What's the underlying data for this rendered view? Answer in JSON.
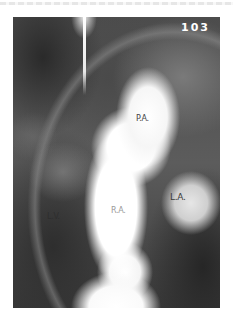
{
  "image": {
    "frame_number": "103",
    "labels": {
      "pulmonary_artery": "P.A.",
      "left_atrium": "L.A.",
      "right_atrium": "R.A.",
      "left_ventricle": "L.V."
    }
  }
}
